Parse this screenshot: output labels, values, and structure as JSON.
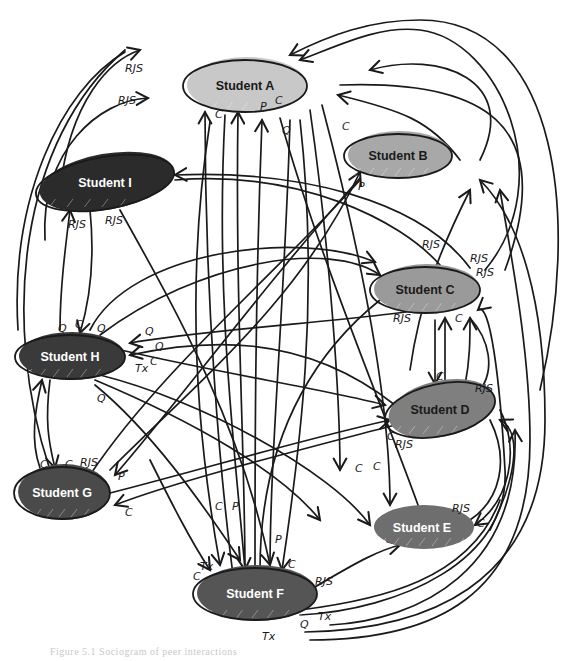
{
  "diagram": {
    "type": "sociogram",
    "background": "#ffffff",
    "stroke_color": "#1a1a1a",
    "nodes": [
      {
        "id": "A",
        "label": "Student A",
        "cx": 245,
        "cy": 86,
        "rx": 62,
        "ry": 26,
        "fill": "#c8c8c8",
        "text_color": "#1a1a1a",
        "outline": true
      },
      {
        "id": "B",
        "label": "Student B",
        "cx": 398,
        "cy": 156,
        "rx": 54,
        "ry": 22,
        "fill": "#a8a8a8",
        "text_color": "#1a1a1a",
        "outline": true
      },
      {
        "id": "I",
        "label": "Student I",
        "cx": 105,
        "cy": 183,
        "rx": 70,
        "ry": 26,
        "fill": "#2b2b2b",
        "text_color": "#ffffff",
        "outline": true,
        "rotate": -10
      },
      {
        "id": "C",
        "label": "Student C",
        "cx": 425,
        "cy": 290,
        "rx": 55,
        "ry": 23,
        "fill": "#9a9a9a",
        "text_color": "#1a1a1a",
        "outline": true
      },
      {
        "id": "H",
        "label": "Student H",
        "cx": 70,
        "cy": 357,
        "rx": 55,
        "ry": 22,
        "fill": "#3a3a3a",
        "text_color": "#ffffff",
        "outline": true
      },
      {
        "id": "D",
        "label": "Student D",
        "cx": 440,
        "cy": 410,
        "rx": 56,
        "ry": 26,
        "fill": "#7f7f7f",
        "text_color": "#1a1a1a",
        "outline": true,
        "rotate": -12
      },
      {
        "id": "G",
        "label": "Student G",
        "cx": 62,
        "cy": 493,
        "rx": 48,
        "ry": 26,
        "fill": "#4a4a4a",
        "text_color": "#ffffff",
        "outline": true
      },
      {
        "id": "E",
        "label": "Student E",
        "cx": 422,
        "cy": 528,
        "rx": 52,
        "ry": 20,
        "fill": "#6e6e6e",
        "text_color": "#ffffff",
        "outline": false
      },
      {
        "id": "F",
        "label": "Student F",
        "cx": 255,
        "cy": 594,
        "rx": 62,
        "ry": 26,
        "fill": "#555555",
        "text_color": "#ffffff",
        "outline": true
      }
    ],
    "edges": [
      {
        "d": "M60,190 C70,100 110,60 140,50",
        "arrow_end": true
      },
      {
        "d": "M45,240 C40,150 100,100 148,98",
        "arrow_end": true
      },
      {
        "d": "M18,330 C10,200 60,90 125,52",
        "arrow_end": false
      },
      {
        "d": "M50,470 C0,320 20,140 125,50",
        "arrow_end": false
      },
      {
        "d": "M485,270 C560,180 500,40 420,30 C380,25 340,45 300,60",
        "arrow_end": true
      },
      {
        "d": "M540,390 C580,220 560,20 420,20 C370,20 330,35 290,55",
        "arrow_end": true
      },
      {
        "d": "M480,160 C520,80 440,50 370,70",
        "arrow_end": true
      },
      {
        "d": "M505,270 C560,120 480,80 340,85",
        "arrow_end": false
      },
      {
        "d": "M460,160 C430,120 400,110 338,95",
        "arrow_end": true
      },
      {
        "d": "M235,590 C220,480 205,300 205,112",
        "arrow_end": true
      },
      {
        "d": "M245,575 C245,450 235,300 238,112",
        "arrow_end": true
      },
      {
        "d": "M255,570 C255,450 255,300 262,120",
        "arrow_end": true
      },
      {
        "d": "M270,570 C270,450 285,300 290,120",
        "arrow_end": false
      },
      {
        "d": "M418,505 C380,400 320,260 280,118",
        "arrow_end": false
      },
      {
        "d": "M210,122 C190,250 190,400 220,565",
        "arrow_end": true
      },
      {
        "d": "M225,115 C215,300 235,450 245,570",
        "arrow_end": true
      },
      {
        "d": "M300,120 C320,300 300,450 282,570",
        "arrow_end": true
      },
      {
        "d": "M310,110 C330,250 340,400 340,470",
        "arrow_end": true
      },
      {
        "d": "M322,105 C360,250 390,400 390,505",
        "arrow_end": true
      },
      {
        "d": "M175,180 C300,170 400,220 440,265",
        "arrow_end": false
      },
      {
        "d": "M470,268 C420,200 300,170 175,175",
        "arrow_end": true
      },
      {
        "d": "M90,330 C130,250 300,230 375,262",
        "arrow_end": true
      },
      {
        "d": "M100,335 C200,260 330,240 380,275",
        "arrow_end": true
      },
      {
        "d": "M90,210 C95,260 90,300 80,333",
        "arrow_end": true
      },
      {
        "d": "M60,330 C60,290 65,250 70,210",
        "arrow_end": true
      },
      {
        "d": "M120,210 C170,300 240,420 270,565",
        "arrow_end": true
      },
      {
        "d": "M50,380 C45,420 48,440 55,468",
        "arrow_end": true
      },
      {
        "d": "M40,468 C30,440 35,410 42,380",
        "arrow_end": true
      },
      {
        "d": "M100,345 C200,370 330,390 385,405",
        "arrow_end": true
      },
      {
        "d": "M395,405 C300,330 200,340 130,355",
        "arrow_end": true
      },
      {
        "d": "M420,310 C360,320 200,330 130,343",
        "arrow_end": true
      },
      {
        "d": "M100,375 C200,400 330,470 370,525",
        "arrow_end": true
      },
      {
        "d": "M95,385 C150,430 200,500 240,560",
        "arrow_end": true
      },
      {
        "d": "M95,380 C190,420 280,470 320,520",
        "arrow_end": true
      },
      {
        "d": "M150,460 C170,500 190,540 210,570",
        "arrow_end": true
      },
      {
        "d": "M110,470 C200,380 300,300 360,172",
        "arrow_end": true
      },
      {
        "d": "M90,475 C160,370 280,270 360,180",
        "arrow_end": false
      },
      {
        "d": "M360,178 C260,290 180,400 115,475",
        "arrow_end": true
      },
      {
        "d": "M410,370 C420,300 440,250 470,190",
        "arrow_end": true
      },
      {
        "d": "M110,493 C200,470 300,440 390,420",
        "arrow_end": true
      },
      {
        "d": "M395,425 C300,450 180,480 115,505",
        "arrow_end": true
      },
      {
        "d": "M380,300 C330,340 260,420 260,570",
        "arrow_end": false
      },
      {
        "d": "M435,320 C435,345 435,365 435,384",
        "arrow_end": true
      },
      {
        "d": "M445,385 C445,360 445,340 445,318",
        "arrow_end": true
      },
      {
        "d": "M465,385 C470,360 470,340 470,318",
        "arrow_end": true
      },
      {
        "d": "M470,318 C490,340 495,370 480,390",
        "arrow_end": false
      },
      {
        "d": "M490,420 C510,460 500,500 470,520",
        "arrow_end": false
      },
      {
        "d": "M500,410 C520,450 510,500 475,525",
        "arrow_end": true
      },
      {
        "d": "M490,530 C520,470 520,430 500,420",
        "arrow_end": true
      },
      {
        "d": "M310,590 C360,560 380,550 400,545",
        "arrow_end": true
      },
      {
        "d": "M300,610 C380,600 470,580 500,500",
        "arrow_end": false
      },
      {
        "d": "M330,625 C420,620 520,570 515,430",
        "arrow_end": true
      },
      {
        "d": "M310,640 C430,640 530,600 530,440 C530,350 510,250 500,190",
        "arrow_end": true
      },
      {
        "d": "M305,632 C420,630 545,590 545,420 C545,300 520,220 480,180",
        "arrow_end": true
      },
      {
        "d": "M300,615 C400,610 510,560 505,470 C500,380 490,300 478,310",
        "arrow_end": true
      }
    ],
    "labels": [
      {
        "text": "RJS",
        "x": 125,
        "y": 72
      },
      {
        "text": "RJS",
        "x": 118,
        "y": 104
      },
      {
        "text": "C",
        "x": 215,
        "y": 118
      },
      {
        "text": "P",
        "x": 260,
        "y": 110
      },
      {
        "text": "C",
        "x": 275,
        "y": 104
      },
      {
        "text": "Q",
        "x": 282,
        "y": 134
      },
      {
        "text": "C",
        "x": 342,
        "y": 130
      },
      {
        "text": "P",
        "x": 358,
        "y": 190
      },
      {
        "text": "RJS",
        "x": 68,
        "y": 228
      },
      {
        "text": "RJS",
        "x": 105,
        "y": 224
      },
      {
        "text": "RJS",
        "x": 422,
        "y": 248
      },
      {
        "text": "RJS",
        "x": 470,
        "y": 262
      },
      {
        "text": "RJS",
        "x": 476,
        "y": 276
      },
      {
        "text": "RJS",
        "x": 393,
        "y": 322
      },
      {
        "text": "C",
        "x": 455,
        "y": 322
      },
      {
        "text": "Q",
        "x": 58,
        "y": 332
      },
      {
        "text": "C",
        "x": 75,
        "y": 328
      },
      {
        "text": "Q",
        "x": 97,
        "y": 332
      },
      {
        "text": "Q",
        "x": 145,
        "y": 335
      },
      {
        "text": "Q",
        "x": 155,
        "y": 350
      },
      {
        "text": "C",
        "x": 150,
        "y": 365
      },
      {
        "text": "Tx",
        "x": 135,
        "y": 372
      },
      {
        "text": "Q",
        "x": 97,
        "y": 402
      },
      {
        "text": "C",
        "x": 436,
        "y": 380
      },
      {
        "text": "RJS",
        "x": 475,
        "y": 392
      },
      {
        "text": "C",
        "x": 387,
        "y": 440
      },
      {
        "text": "RJS",
        "x": 395,
        "y": 448
      },
      {
        "text": "C",
        "x": 40,
        "y": 468
      },
      {
        "text": "C",
        "x": 65,
        "y": 468
      },
      {
        "text": "RJS",
        "x": 80,
        "y": 466
      },
      {
        "text": "P",
        "x": 118,
        "y": 480
      },
      {
        "text": "C",
        "x": 125,
        "y": 516
      },
      {
        "text": "C",
        "x": 215,
        "y": 510
      },
      {
        "text": "P",
        "x": 232,
        "y": 510
      },
      {
        "text": "C",
        "x": 355,
        "y": 472
      },
      {
        "text": "C",
        "x": 373,
        "y": 470
      },
      {
        "text": "P",
        "x": 275,
        "y": 543
      },
      {
        "text": "C",
        "x": 288,
        "y": 568
      },
      {
        "text": "C",
        "x": 193,
        "y": 580
      },
      {
        "text": "Tx",
        "x": 200,
        "y": 570
      },
      {
        "text": "RJS",
        "x": 315,
        "y": 585
      },
      {
        "text": "RJS",
        "x": 452,
        "y": 512
      },
      {
        "text": "C",
        "x": 477,
        "y": 527
      },
      {
        "text": "Q",
        "x": 300,
        "y": 628
      },
      {
        "text": "Tx",
        "x": 318,
        "y": 620
      },
      {
        "text": "Tx",
        "x": 262,
        "y": 640
      }
    ]
  },
  "caption": {
    "text": "Figure 5.1 Sociogram of peer interactions"
  }
}
